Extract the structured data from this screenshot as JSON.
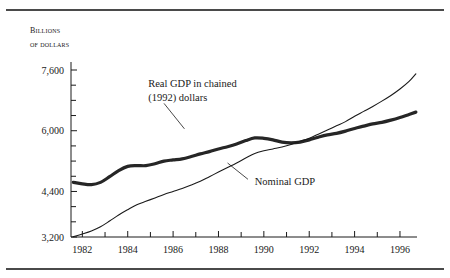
{
  "figure": {
    "top_rule": "horizontal-rule",
    "bottom_rule": "horizontal-rule",
    "axis_title_line1": "Billions",
    "axis_title_line2": "of dollars"
  },
  "chart_data": {
    "type": "line",
    "title": "",
    "subtitle": "",
    "xlabel": "",
    "ylabel": "Billions of dollars",
    "xlim": [
      1981.5,
      1996.75
    ],
    "ylim": [
      3200,
      7800
    ],
    "grid": false,
    "legend_position": "inline-annotations",
    "xticks_major": [
      1982,
      1984,
      1986,
      1988,
      1990,
      1992,
      1994,
      1996
    ],
    "xticks_minor": [
      1983,
      1985,
      1987,
      1989,
      1991,
      1993,
      1995
    ],
    "xtick_labels": [
      "1982",
      "1984",
      "1986",
      "1988",
      "1990",
      "1992",
      "1994",
      "1996"
    ],
    "yticks_major": [
      3200,
      4400,
      6000,
      7600
    ],
    "ytick_labels": [
      "3,200",
      "4,400",
      "6,000",
      "7,600"
    ],
    "yticks_minor": [
      3600,
      4000,
      4800,
      5200,
      5600,
      6400,
      6800,
      7200
    ],
    "series": [
      {
        "name": "Real GDP in chained (1992) dollars",
        "style": "thick",
        "annotation": "Real GDP in chained\n(1992) dollars",
        "x": [
          1981.6,
          1982.0,
          1982.4,
          1982.8,
          1983.2,
          1983.6,
          1984.0,
          1984.4,
          1984.8,
          1985.2,
          1985.6,
          1986.0,
          1986.4,
          1986.8,
          1987.2,
          1987.6,
          1988.0,
          1988.4,
          1988.8,
          1989.2,
          1989.6,
          1990.0,
          1990.4,
          1990.8,
          1991.2,
          1991.6,
          1992.0,
          1992.4,
          1992.8,
          1993.2,
          1993.6,
          1994.0,
          1994.4,
          1994.8,
          1995.2,
          1995.6,
          1996.0,
          1996.4,
          1996.7
        ],
        "y": [
          4640,
          4600,
          4580,
          4640,
          4790,
          4950,
          5060,
          5080,
          5080,
          5130,
          5200,
          5230,
          5260,
          5320,
          5390,
          5450,
          5520,
          5580,
          5650,
          5740,
          5810,
          5800,
          5760,
          5700,
          5680,
          5700,
          5760,
          5830,
          5890,
          5930,
          5990,
          6060,
          6120,
          6180,
          6220,
          6280,
          6350,
          6430,
          6490
        ]
      },
      {
        "name": "Nominal GDP",
        "style": "thin",
        "annotation": "Nominal GDP",
        "x": [
          1981.6,
          1982.0,
          1982.4,
          1982.8,
          1983.2,
          1983.6,
          1984.0,
          1984.4,
          1984.8,
          1985.2,
          1985.6,
          1986.0,
          1986.4,
          1986.8,
          1987.2,
          1987.6,
          1988.0,
          1988.4,
          1988.8,
          1989.2,
          1989.6,
          1990.0,
          1990.4,
          1990.8,
          1991.2,
          1991.6,
          1992.0,
          1992.4,
          1992.8,
          1993.2,
          1993.6,
          1994.0,
          1994.4,
          1994.8,
          1995.2,
          1995.6,
          1996.0,
          1996.4,
          1996.7
        ],
        "y": [
          3210,
          3280,
          3360,
          3470,
          3620,
          3780,
          3920,
          4050,
          4140,
          4230,
          4320,
          4400,
          4480,
          4570,
          4670,
          4790,
          4910,
          5030,
          5150,
          5280,
          5400,
          5470,
          5520,
          5570,
          5640,
          5720,
          5800,
          5910,
          6020,
          6130,
          6240,
          6380,
          6510,
          6640,
          6780,
          6930,
          7100,
          7300,
          7500
        ]
      }
    ],
    "annotations": [
      {
        "name": "real-gdp-annotation",
        "text_line1": "Real GDP in chained",
        "text_line2": "(1992) dollars",
        "x": 1984.9,
        "y": 7150,
        "leader_from": [
          1985.6,
          6720
        ],
        "leader_to": [
          1986.5,
          6050
        ]
      },
      {
        "name": "nominal-gdp-annotation",
        "text_line1": "Nominal GDP",
        "x": 1989.6,
        "y": 4580,
        "leader_from": [
          1989.3,
          4720
        ],
        "leader_to": [
          1988.4,
          5150
        ]
      }
    ]
  }
}
